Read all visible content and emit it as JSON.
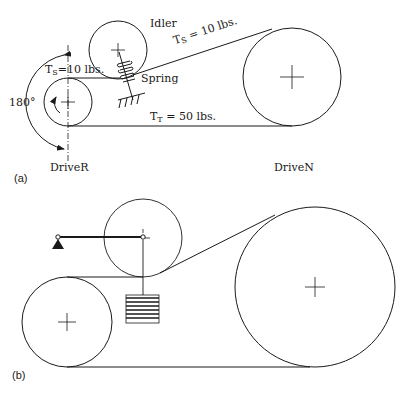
{
  "figure_a": {
    "panel_label": "(a)",
    "idler_label": "Idler",
    "spring_label": "Spring",
    "slack_tension_left": {
      "symbol": "T",
      "subscript": "S",
      "value": "=10 lbs."
    },
    "slack_tension_right": {
      "symbol": "T",
      "subscript": "S",
      "value": " = 10 lbs."
    },
    "tight_tension": {
      "symbol": "T",
      "subscript": "T",
      "value": " = 50 lbs."
    },
    "wrap_angle": "180°",
    "driver_label": "DriveR",
    "driven_label": "DriveN"
  },
  "figure_b": {
    "panel_label": "(b)"
  },
  "colors": {
    "line": "#1a1a1a",
    "background": "#ffffff"
  }
}
